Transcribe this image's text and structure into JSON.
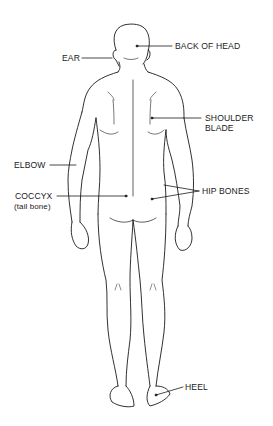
{
  "diagram": {
    "title": "",
    "view": "posterior",
    "line_color": "#1a1a1a",
    "background": "#ffffff"
  },
  "labels": {
    "back_of_head": "BACK OF HEAD",
    "ear": "EAR",
    "shoulder_blade_line1": "SHOULDER",
    "shoulder_blade_line2": "BLADE",
    "elbow": "ELBOW",
    "coccyx": "COCCYX",
    "coccyx_sub": "(tail bone)",
    "hip_bones": "HIP BONES",
    "heel": "HEEL"
  }
}
